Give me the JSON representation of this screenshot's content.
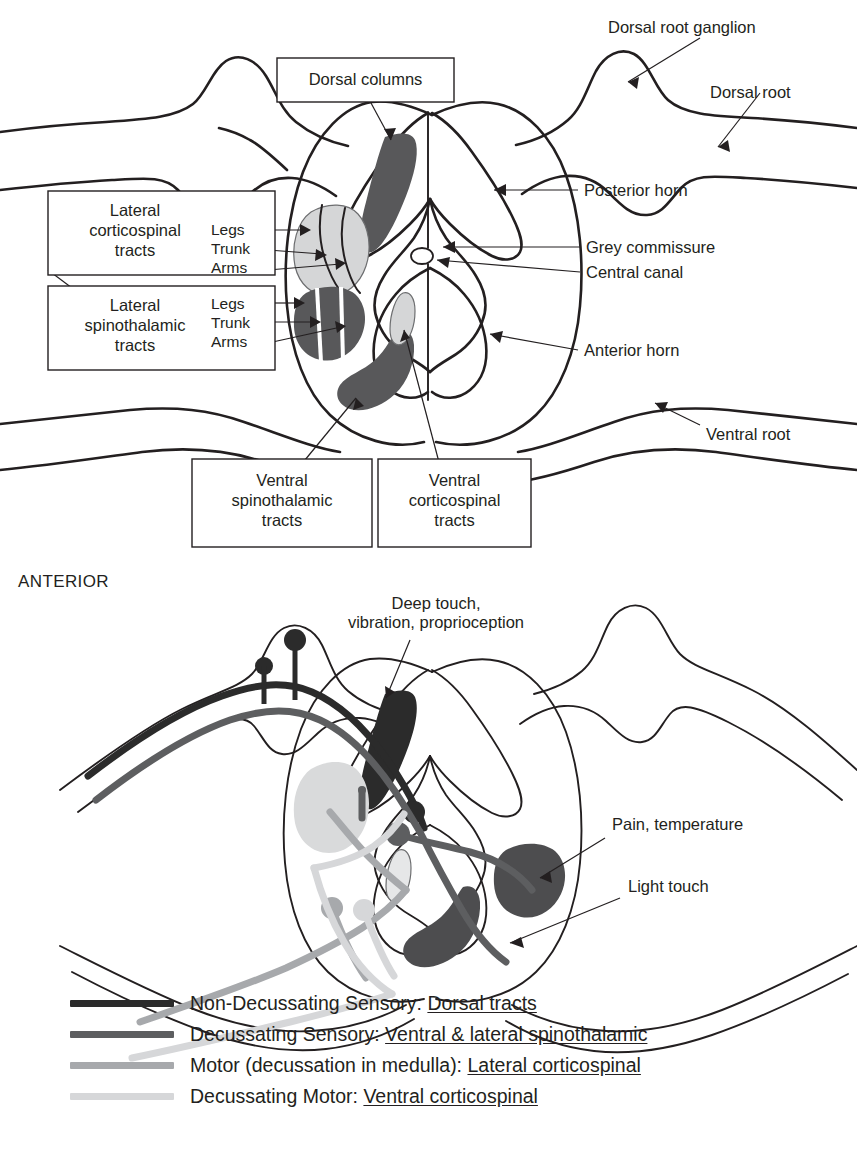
{
  "figure": {
    "orientation_label": "ANTERIOR"
  },
  "top_diagram": {
    "callout_boxes": [
      {
        "id": "dorsal-columns",
        "label": "Dorsal columns"
      },
      {
        "id": "lateral-corticospinal",
        "label": "Lateral\ncorticospinal\ntracts",
        "lines": [
          "Lateral",
          "corticospinal",
          "tracts"
        ]
      },
      {
        "id": "lateral-spinothalamic",
        "label": "Lateral\nspinothalamic\ntracts",
        "lines": [
          "Lateral",
          "spinothalamic",
          "tracts"
        ]
      },
      {
        "id": "ventral-spinothalamic",
        "label": "Ventral\nspinothalamic\ntracts",
        "lines": [
          "Ventral",
          "spinothalamic",
          "tracts"
        ]
      },
      {
        "id": "ventral-corticospinal",
        "label": "Ventral\ncorticospinal\ntracts",
        "lines": [
          "Ventral",
          "corticospinal",
          "tracts"
        ]
      }
    ],
    "somatotopy": {
      "corticospinal": [
        "Legs",
        "Trunk",
        "Arms"
      ],
      "spinothalamic": [
        "Legs",
        "Trunk",
        "Arms"
      ]
    },
    "right_labels": [
      {
        "id": "dorsal-root-ganglion",
        "label": "Dorsal root ganglion"
      },
      {
        "id": "dorsal-root",
        "label": "Dorsal root"
      },
      {
        "id": "posterior-horn",
        "label": "Posterior horn"
      },
      {
        "id": "grey-commissure",
        "label": "Grey commissure"
      },
      {
        "id": "central-canal",
        "label": "Central canal"
      },
      {
        "id": "anterior-horn",
        "label": "Anterior horn"
      },
      {
        "id": "ventral-root",
        "label": "Ventral root"
      }
    ]
  },
  "bottom_diagram": {
    "labels": [
      {
        "id": "deep-touch",
        "line1": "Deep touch,",
        "line2": "vibration, proprioception"
      },
      {
        "id": "pain-temperature",
        "label": "Pain, temperature"
      },
      {
        "id": "light-touch",
        "label": "Light touch"
      }
    ]
  },
  "legend": {
    "items": [
      {
        "id": "non-decussating-sensory",
        "prefix": "Non-Decussating Sensory: ",
        "tract": "Dorsal tracts",
        "color": "#2b2b2b"
      },
      {
        "id": "decussating-sensory",
        "prefix": "Decussating Sensory: ",
        "tract": "Ventral & lateral spinothalamic",
        "color": "#5d5e60"
      },
      {
        "id": "motor-lateral-corticospinal",
        "prefix": "Motor (decussation in medulla): ",
        "tract": "Lateral corticospinal",
        "color": "#a7a9ac"
      },
      {
        "id": "decussating-motor",
        "prefix": "Decussating Motor: ",
        "tract": "Ventral corticospinal",
        "color": "#d6d7d9"
      }
    ]
  }
}
